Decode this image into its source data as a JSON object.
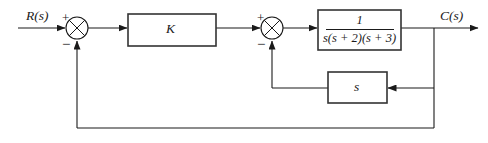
{
  "diagram": {
    "type": "control-system-block-diagram",
    "signals": {
      "input_label": "R(s)",
      "output_label": "C(s)"
    },
    "blocks": [
      {
        "id": "gain",
        "label": "K",
        "x": 128,
        "y": 14,
        "w": 88,
        "h": 32
      },
      {
        "id": "plant",
        "numerator": "1",
        "denominator": "s(s + 2)(s + 3)",
        "x": 318,
        "y": 10,
        "w": 83,
        "h": 40
      },
      {
        "id": "derivative",
        "label": "s",
        "x": 328,
        "y": 72,
        "w": 59,
        "h": 31
      }
    ],
    "summing_junctions": [
      {
        "id": "summer-1",
        "cx": 77,
        "cy": 28,
        "r": 11,
        "input_sign": "+",
        "feedback_sign": "−"
      },
      {
        "id": "summer-2",
        "cx": 272,
        "cy": 28,
        "r": 11,
        "input_sign": "+",
        "feedback_sign": "−"
      }
    ],
    "signs": {
      "plus": "+",
      "minus": "−"
    },
    "feedback_paths": [
      {
        "id": "inner-loop",
        "from": "output-takeoff",
        "through": "derivative",
        "to": "summer-2",
        "y": 88
      },
      {
        "id": "outer-loop",
        "from": "output-takeoff",
        "to": "summer-1",
        "y": 128
      }
    ],
    "colors": {
      "line": "#1a1a1a",
      "block_border": "#333333",
      "background": "#ffffff",
      "text": "#1a1a1a"
    }
  }
}
